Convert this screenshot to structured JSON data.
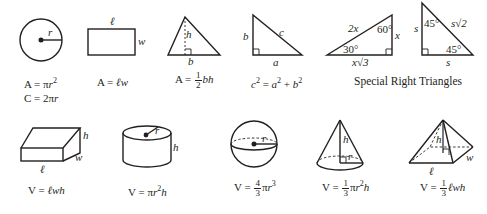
{
  "figures": [
    {
      "name": "circle",
      "labels": {
        "radius": "r"
      },
      "formulas": [
        "A = πr²",
        "C = 2πr"
      ]
    },
    {
      "name": "rectangle",
      "labels": {
        "length": "ℓ",
        "width": "w"
      },
      "formulas": [
        "A = ℓw"
      ]
    },
    {
      "name": "triangle",
      "labels": {
        "height": "h",
        "base": "b"
      },
      "formulas": [
        "A = 1/2 bh"
      ]
    },
    {
      "name": "right-triangle",
      "labels": {
        "leg_a": "a",
        "leg_b": "b",
        "hypotenuse": "c"
      },
      "formulas": [
        "c² = a² + b²"
      ]
    },
    {
      "name": "30-60-90-triangle",
      "labels": {
        "hyp": "2x",
        "short": "x",
        "long": "x√3",
        "angle_small": "30°",
        "angle_large": "60°"
      }
    },
    {
      "name": "45-45-90-triangle",
      "labels": {
        "leg1": "s",
        "leg2": "s",
        "hyp": "s√2",
        "angle_top": "45°",
        "angle_bottom": "45°"
      }
    },
    {
      "name": "rectangular-prism",
      "labels": {
        "length": "ℓ",
        "width": "w",
        "height": "h"
      },
      "formulas": [
        "V = ℓwh"
      ]
    },
    {
      "name": "cylinder",
      "labels": {
        "radius": "r",
        "height": "h"
      },
      "formulas": [
        "V = πr²h"
      ]
    },
    {
      "name": "sphere",
      "labels": {
        "radius": "r"
      },
      "formulas": [
        "V = 4/3 πr³"
      ]
    },
    {
      "name": "cone",
      "labels": {
        "radius": "r",
        "height": "h"
      },
      "formulas": [
        "V = 1/3 πr²h"
      ]
    },
    {
      "name": "pyramid",
      "labels": {
        "length": "ℓ",
        "width": "w",
        "height": "h"
      },
      "formulas": [
        "V = 1/3 ℓwh"
      ]
    }
  ],
  "special_title": "Special Right Triangles",
  "text": {
    "r": "r",
    "h": "h",
    "b": "b",
    "a": "a",
    "c": "c",
    "w": "w",
    "l": "ℓ",
    "s": "s",
    "two_x": "2x",
    "x": "x",
    "x_root3": "x√3",
    "s_root2": "s√2",
    "deg30": "30°",
    "deg60": "60°",
    "deg45": "45°",
    "one": "1",
    "two": "2",
    "three": "3",
    "four": "4",
    "circle_area_lhs": "A = π",
    "circle_area_r": "r",
    "sq": "2",
    "cube": "3",
    "circle_circ": "C = 2π",
    "rect_area": "A = ",
    "rect_area_vars": "ℓw",
    "tri_area_lhs": "A = ",
    "tri_area_vars": "bh",
    "pyth_c": "c",
    "pyth_eq": " = ",
    "pyth_a": "a",
    "pyth_plus": " + ",
    "pyth_b": "b",
    "v_eq": "V = ",
    "prism_vars": "ℓwh",
    "cyl_pi": "π",
    "cyl_r": "r",
    "cyl_h": "h",
    "sph_pi": "π",
    "sph_r": "r",
    "cone_pi": "π",
    "cone_r": "r",
    "cone_h": "h",
    "pyr_vars": "ℓwh"
  }
}
